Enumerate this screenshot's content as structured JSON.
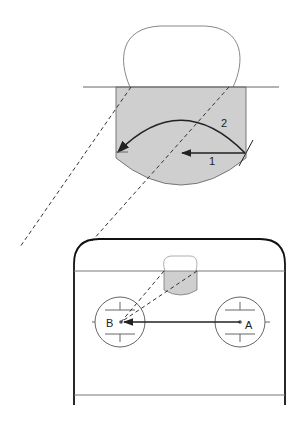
{
  "labels": {
    "arrow_1": "1",
    "arrow_2": "2",
    "point_a": "A",
    "point_b": "B"
  },
  "colors": {
    "fill_gray": "#cfcfcf",
    "stroke_dark": "#222222",
    "stroke_gray": "#777777"
  }
}
